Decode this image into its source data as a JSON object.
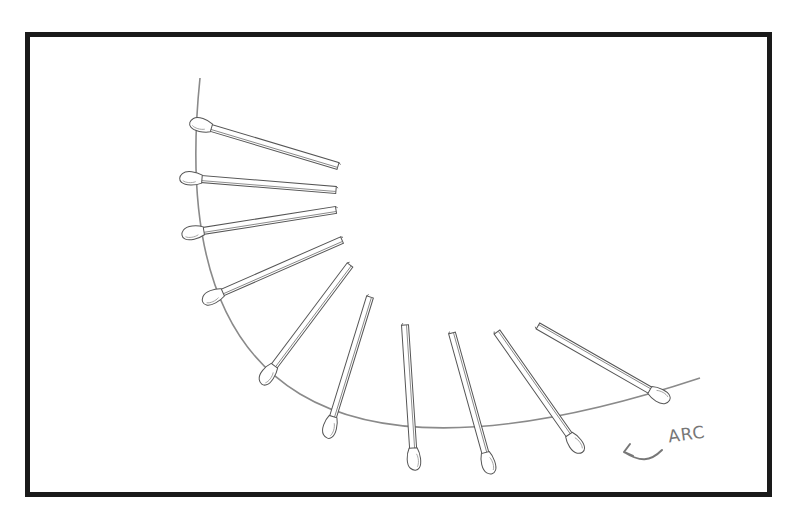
{
  "diagram": {
    "annotation": {
      "label": "ARC",
      "arrow": "pointing-left-to-arc"
    },
    "colors": {
      "frame": "#1a1a1a",
      "stroke": "#555555",
      "arc": "#8a8a8a",
      "label": "#777777"
    },
    "arc": {
      "start": [
        200,
        78
      ],
      "end": [
        700,
        378
      ],
      "control": [
        150,
        560
      ]
    },
    "matchsticks": [
      {
        "head": [
          198,
          124
        ],
        "tail": [
          338,
          166
        ]
      },
      {
        "head": [
          188,
          178
        ],
        "tail": [
          336,
          190
        ]
      },
      {
        "head": [
          190,
          233
        ],
        "tail": [
          336,
          210
        ]
      },
      {
        "head": [
          210,
          298
        ],
        "tail": [
          342,
          240
        ]
      },
      {
        "head": [
          266,
          377
        ],
        "tail": [
          350,
          265
        ]
      },
      {
        "head": [
          329,
          430
        ],
        "tail": [
          370,
          297
        ]
      },
      {
        "head": [
          414,
          462
        ],
        "tail": [
          405,
          325
        ]
      },
      {
        "head": [
          489,
          466
        ],
        "tail": [
          452,
          333
        ]
      },
      {
        "head": [
          577,
          446
        ],
        "tail": [
          497,
          332
        ]
      },
      {
        "head": [
          662,
          397
        ],
        "tail": [
          538,
          326
        ]
      }
    ]
  }
}
